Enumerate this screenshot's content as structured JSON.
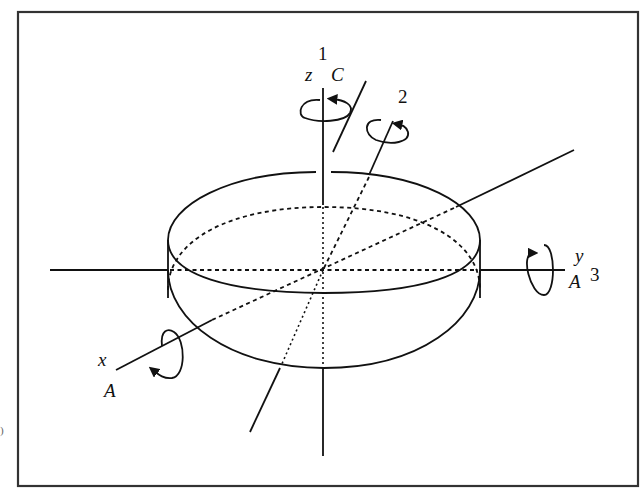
{
  "figure": {
    "frame_color": "#333333",
    "line_color": "#111111",
    "background": "#ffffff"
  },
  "labels": {
    "axis1_number": "1",
    "axis_z": "z",
    "moment_C": "C",
    "axis2_number": "2",
    "axis_y": "y",
    "axis_y_moment": "A",
    "axis3_number": "3",
    "axis_x": "x",
    "axis_x_moment": "A"
  },
  "edge_fragment": ")"
}
